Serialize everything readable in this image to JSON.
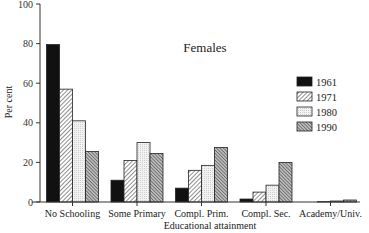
{
  "chart_data": {
    "type": "bar",
    "title": "Females",
    "xlabel": "Educational attainment",
    "ylabel": "Per cent",
    "ylim": [
      0,
      100
    ],
    "yticks": [
      0,
      20,
      40,
      60,
      80,
      100
    ],
    "grid": false,
    "legend_position": "right",
    "categories": [
      "No Schooling",
      "Some Primary",
      "Compl. Prim.",
      "Compl. Sec.",
      "Academy/Univ."
    ],
    "series": [
      {
        "name": "1961",
        "pattern": "solid-black",
        "values": [
          79.5,
          11,
          7,
          1.5,
          0
        ]
      },
      {
        "name": "1971",
        "pattern": "diagonal-hatch",
        "values": [
          57,
          21,
          16,
          5,
          0.2
        ]
      },
      {
        "name": "1980",
        "pattern": "light-dotted",
        "values": [
          41,
          30,
          18.5,
          8.5,
          0.5
        ]
      },
      {
        "name": "1990",
        "pattern": "dense-crosshatch",
        "values": [
          25.5,
          24.5,
          27.5,
          20,
          1
        ]
      }
    ]
  },
  "colors": {
    "axis": "#333333",
    "s1961": "#111111",
    "s1971": "#ffffff",
    "s1980": "#e8e8e8",
    "s1990": "#777777"
  }
}
